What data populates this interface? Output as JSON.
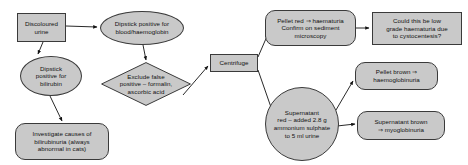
{
  "diagram": {
    "background": "#ffffff",
    "node_fill": "#c9c9c9",
    "node_stroke": "#3a3a3a",
    "text_color": "#111111",
    "nodes": [
      {
        "id": "discoloured-urine",
        "shape": "rect",
        "label": "Discoloured\nurine",
        "x": 17,
        "y": 13,
        "w": 49,
        "h": 29
      },
      {
        "id": "dipstick-blood",
        "shape": "ellipse",
        "label": "Dipstick positive for\nblood/haemoglobin",
        "x": 100,
        "y": 11,
        "w": 84,
        "h": 34
      },
      {
        "id": "dipstick-bilirubin",
        "shape": "ellipse",
        "label": "Dipstick\npositive for\nbilirubin",
        "x": 20,
        "y": 56,
        "w": 62,
        "h": 40
      },
      {
        "id": "exclude-false-positive",
        "shape": "diamond",
        "label": "Exclude false\npositive – formalin,\nascorbic acid",
        "x": 101,
        "y": 62,
        "w": 90,
        "h": 44
      },
      {
        "id": "investigate-bilirubinuria",
        "shape": "round",
        "label": "Investigate causes of\nbilirubinuria (always\nabnormal in cats)",
        "x": 15,
        "y": 123,
        "w": 94,
        "h": 37
      },
      {
        "id": "centrifuge",
        "shape": "rect",
        "label": "Centrifuge",
        "x": 210,
        "y": 54,
        "w": 48,
        "h": 18
      },
      {
        "id": "pellet-red",
        "shape": "round",
        "label": "Pellet red ⇒ haematuria\nConfirm on sediment\nmicroscopy",
        "x": 265,
        "y": 10,
        "w": 91,
        "h": 36
      },
      {
        "id": "low-grade-haematuria",
        "shape": "rect",
        "label": "Could this be low\ngrade haematuria due\nto cystocentesis?",
        "x": 372,
        "y": 12,
        "w": 90,
        "h": 33
      },
      {
        "id": "supernatant-red",
        "shape": "circle",
        "label": "Supernatant\nred – added 2.8 g\nammonium sulphate\nto 5 ml urine",
        "x": 265,
        "y": 87,
        "w": 74,
        "h": 74
      },
      {
        "id": "pellet-brown",
        "shape": "round",
        "label": "Pellet brown ⇒\nhaemoglobinuria",
        "x": 355,
        "y": 62,
        "w": 83,
        "h": 28
      },
      {
        "id": "supernatant-brown",
        "shape": "round",
        "label": "Supernatant brown\n⇒ myoglobinuria",
        "x": 357,
        "y": 111,
        "w": 88,
        "h": 29
      }
    ],
    "edges": [
      {
        "id": "edge-urine-to-blood",
        "from": "discoloured-urine",
        "to": "dipstick-blood",
        "d": "M 66,26 L 97,27"
      },
      {
        "id": "edge-urine-to-bilirubin",
        "from": "discoloured-urine",
        "to": "dipstick-bilirubin",
        "d": "M 43,42 L 38,54"
      },
      {
        "id": "edge-blood-to-exclude",
        "from": "dipstick-blood",
        "to": "exclude-false-positive",
        "d": "M 143,45 L 146,60"
      },
      {
        "id": "edge-bilirubin-to-investig",
        "from": "dipstick-bilirubin",
        "to": "investigate-bilirubinuria",
        "d": "M 50,96 L 62,121"
      },
      {
        "id": "edge-exclude-to-centrifuge",
        "from": "exclude-false-positive",
        "to": "centrifuge",
        "d": "M 183,95 L 208,66"
      },
      {
        "id": "edge-centrifuge-to-pellet",
        "from": "centrifuge",
        "to": "pellet-red",
        "d": "M 258,57 L 268,34"
      },
      {
        "id": "edge-centrifuge-to-supern",
        "from": "centrifuge",
        "to": "supernatant-red",
        "d": "M 258,70 L 273,113"
      },
      {
        "id": "edge-pellet-to-lowgrade",
        "from": "pellet-red",
        "to": "low-grade-haematuria",
        "d": "M 356,28 L 369,28"
      },
      {
        "id": "edge-supern-to-pelletbrown",
        "from": "supernatant-red",
        "to": "pellet-brown",
        "d": "M 336,110 L 353,81"
      },
      {
        "id": "edge-supern-to-supernbrown",
        "from": "supernatant-red",
        "to": "supernatant-brown",
        "d": "M 337,126 L 355,124"
      }
    ]
  }
}
